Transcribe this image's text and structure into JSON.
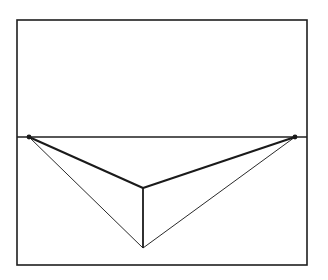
{
  "figure": {
    "type": "line-diagram",
    "canvas": {
      "width": 328,
      "height": 280
    },
    "background_color": "#ffffff",
    "ink_color": "#1a1a1a",
    "frame": {
      "name": "picture-plane-border",
      "x": 17,
      "y": 20,
      "width": 290,
      "height": 245,
      "stroke_width": 1.6,
      "stroke_color": "#1f1f1f"
    },
    "horizon": {
      "name": "horizon-line",
      "x1": 17,
      "y1": 137,
      "x2": 307,
      "y2": 137,
      "stroke_width": 1.5,
      "stroke_color": "#1f1f1f"
    },
    "points": [
      {
        "id": "vp_left",
        "label": "left vanishing point",
        "x": 29,
        "y": 137,
        "marker": "dot",
        "radius": 2.4
      },
      {
        "id": "vp_right",
        "label": "right vanishing point",
        "x": 295,
        "y": 137,
        "marker": "dot",
        "radius": 2.4
      },
      {
        "id": "corner_top",
        "label": "near vertical edge top",
        "x": 143,
        "y": 188,
        "marker": "none",
        "radius": 0
      },
      {
        "id": "corner_bottom",
        "label": "near vertical edge bottom",
        "x": 143,
        "y": 248,
        "marker": "none",
        "radius": 0
      }
    ],
    "lines": [
      {
        "id": "lvp_to_corner_top",
        "label": "left top receding edge",
        "x1": 29,
        "y1": 137,
        "x2": 143,
        "y2": 188,
        "stroke_width": 2.0,
        "stroke_color": "#1a1a1a"
      },
      {
        "id": "rvp_to_corner_top",
        "label": "right top receding edge",
        "x1": 295,
        "y1": 137,
        "x2": 143,
        "y2": 188,
        "stroke_width": 2.0,
        "stroke_color": "#1a1a1a"
      },
      {
        "id": "lvp_to_corner_bottom",
        "label": "left bottom receding edge",
        "x1": 29,
        "y1": 137,
        "x2": 143,
        "y2": 248,
        "stroke_width": 1.0,
        "stroke_color": "#2a2a2a"
      },
      {
        "id": "rvp_to_corner_bottom",
        "label": "right bottom receding edge",
        "x1": 295,
        "y1": 137,
        "x2": 143,
        "y2": 248,
        "stroke_width": 1.0,
        "stroke_color": "#2a2a2a"
      },
      {
        "id": "near_vertical_edge",
        "label": "near vertical edge",
        "x1": 143,
        "y1": 188,
        "x2": 143,
        "y2": 248,
        "stroke_width": 1.8,
        "stroke_color": "#1a1a1a"
      }
    ]
  }
}
